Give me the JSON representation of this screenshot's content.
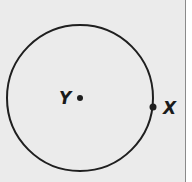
{
  "diagram": {
    "type": "circle",
    "colors": {
      "background": "#ebebeb",
      "stroke": "#1f1f1f",
      "border": "#8a8a8a"
    },
    "circle": {
      "cx": 80,
      "cy": 98,
      "r": 73
    },
    "points": [
      {
        "label": "Y",
        "role": "center",
        "x": 80,
        "y": 98
      },
      {
        "label": "X",
        "role": "on-circle",
        "x": 153,
        "y": 107
      }
    ]
  }
}
